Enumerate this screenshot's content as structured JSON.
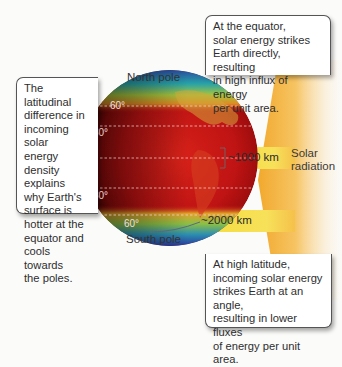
{
  "diagram": {
    "callouts": {
      "top": "At the equator,\nsolar energy strikes\nEarth directly, resulting\nin high influx of energy\nper unit area.",
      "left": "The latitudinal\ndifference in\nincoming solar\nenergy\ndensity\nexplains\nwhy Earth's\nsurface is\nhotter at the\nequator and\ncools towards\nthe poles.",
      "bottom": "At high latitude,\nincoming solar energy\nstrikes Earth at an angle,\nresulting in lower fluxes\nof energy per unit area."
    },
    "globe": {
      "north_label": "North pole",
      "south_label": "South pole",
      "latitudes": [
        "60°",
        "30°",
        "0°",
        "30°",
        "60°"
      ]
    },
    "beams": [
      {
        "label": "~1000 km",
        "position": "equator"
      },
      {
        "label": "~2000 km",
        "position": "high latitude"
      }
    ],
    "source_label": "Solar\nradiation",
    "colors": {
      "beam": "#f6df4a",
      "source": "#f3b13c",
      "globe_hot": "#c41414",
      "globe_cold": "#2a3fa0"
    }
  }
}
